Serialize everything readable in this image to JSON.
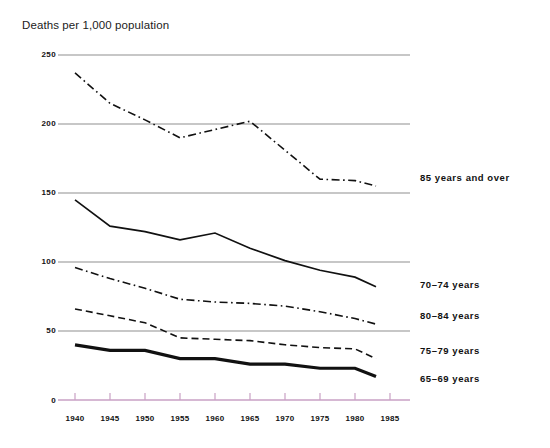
{
  "chart_data": {
    "type": "line",
    "title": "Deaths per 1,000 population",
    "xlabel": "",
    "ylabel": "Deaths per 1,000 population",
    "x": [
      1940,
      1945,
      1950,
      1955,
      1960,
      1965,
      1970,
      1975,
      1980,
      1983
    ],
    "xlim": [
      1938,
      1986
    ],
    "ylim": [
      0,
      250
    ],
    "yticks": [
      0,
      50,
      100,
      150,
      200,
      250
    ],
    "xticks": [
      1940,
      1945,
      1950,
      1955,
      1960,
      1965,
      1970,
      1975,
      1980,
      1985
    ],
    "grid": "horizontal",
    "legend_position": "right-of-line-ends",
    "series": [
      {
        "name": "85 years and over",
        "style": "dash-dot",
        "color": "#111111",
        "width": 1.6,
        "values": [
          237,
          215,
          203,
          190,
          196,
          202,
          181,
          160,
          159,
          155
        ]
      },
      {
        "name": "70-74 years",
        "style": "solid",
        "color": "#111111",
        "width": 1.7,
        "values": [
          145,
          126,
          122,
          116,
          121,
          110,
          101,
          94,
          89,
          82
        ]
      },
      {
        "name": "80-84 years",
        "style": "dash-dot",
        "color": "#111111",
        "width": 1.6,
        "values": [
          96,
          88,
          81,
          73,
          71,
          70,
          68,
          64,
          59,
          55
        ]
      },
      {
        "name": "75-79 years",
        "style": "dashed",
        "color": "#111111",
        "width": 1.6,
        "values": [
          66,
          61,
          56,
          45,
          44,
          43,
          40,
          38,
          37,
          30
        ]
      },
      {
        "name": "65-69 years",
        "style": "solid-thick",
        "color": "#111111",
        "width": 3.2,
        "values": [
          40,
          36,
          36,
          30,
          30,
          26,
          26,
          23,
          23,
          17
        ]
      }
    ]
  },
  "axes": {
    "y_tick_labels": [
      "250",
      "200",
      "150",
      "100",
      "50",
      "0"
    ],
    "x_tick_labels": [
      "1940",
      "1945",
      "1950",
      "1955",
      "1960",
      "1965",
      "1970",
      "1975",
      "1980",
      "1985"
    ],
    "gridline_color": "#8f8f8f",
    "baseline_color": "#c9a0c4"
  },
  "legend": {
    "items": [
      {
        "label": "85 years and over"
      },
      {
        "label": "70–74 years"
      },
      {
        "label": "80–84 years"
      },
      {
        "label": "75–79 years"
      },
      {
        "label": "65–69 years"
      }
    ]
  }
}
